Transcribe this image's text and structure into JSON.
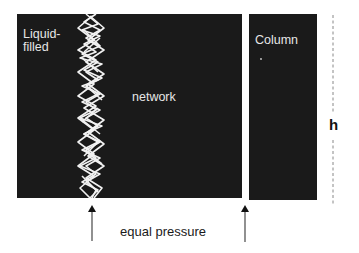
{
  "figure": {
    "type": "capillary-pressure-diagram",
    "labels": {
      "liquid_filled_line1": "Liquid-",
      "liquid_filled_line2": "filled",
      "network": "network",
      "column": "Column",
      "height": "h",
      "equal_pressure": "equal pressure"
    },
    "colors": {
      "panel": "#1a1a1a",
      "panel_text": "#e6e6e6",
      "network_strand": "#f2f2f2",
      "arrow": "#555555",
      "dashed_line": "#888888",
      "background": "#ffffff"
    },
    "elements": {
      "network_panel": {
        "x": 17,
        "y": 14,
        "w": 225,
        "h": 184
      },
      "column_panel": {
        "x": 249,
        "y": 14,
        "w": 68,
        "h": 186
      },
      "strand_center_x": 92,
      "arrows_x": [
        92,
        245
      ],
      "height_marker_x": 333
    }
  }
}
